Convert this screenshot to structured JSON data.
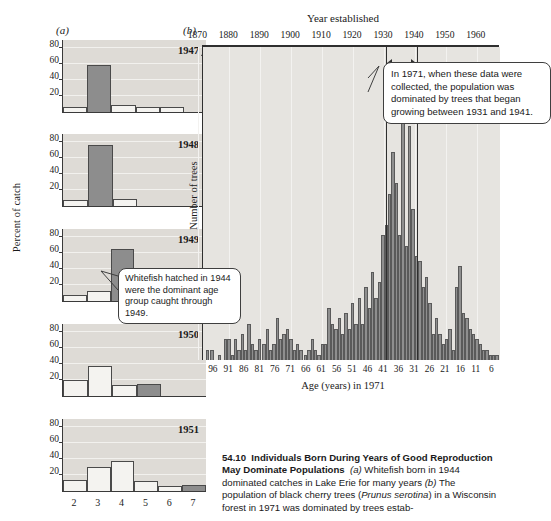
{
  "panel_a": {
    "letter": "(a)",
    "ylabel": "Percent of catch",
    "yticks": [
      20,
      40,
      60,
      80
    ],
    "xticks": [
      "2",
      "3",
      "4",
      "5",
      "6",
      "7"
    ],
    "callout": "Whitefish hatched in 1944 were the dominant age group caught through 1949."
  },
  "panel_b": {
    "letter": "(b)",
    "title": "Year established",
    "ylabel": "Number of trees",
    "xlabel": "Age (years) in 1971",
    "top_ticks": [
      1870,
      1880,
      1890,
      1900,
      1910,
      1920,
      1930,
      1940,
      1950,
      1960
    ],
    "bottom_ticks": [
      96,
      91,
      86,
      81,
      76,
      71,
      66,
      61,
      56,
      51,
      46,
      41,
      36,
      31,
      26,
      21,
      16,
      11,
      6
    ],
    "callout": "In 1971, when these data were collected, the population was dominated by trees that began growing between 1931 and 1941."
  },
  "caption": {
    "number": "54.10",
    "title": "Individuals Born During Years of Good Reproduction May Dominate Populations",
    "part_a_letter": "(a)",
    "part_a_text_1": "Whitefish born in 1944 dominated catches in Lake Erie for many years",
    "part_b_letter": "(b)",
    "part_b_text_1": "The population of black cherry trees (",
    "species": "Prunus serotina",
    "part_b_text_2": ") in a Wisconsin forest in 1971 was dominated by trees estab-"
  },
  "colors": {
    "plot_background": "#dedbd6",
    "bar_dark": "#8d8d8d",
    "bar_light": "#f4f3f0",
    "axis": "#3a3a3a"
  },
  "chart_data": [
    {
      "type": "bar",
      "title": "1947",
      "xlabel": "Age (years)",
      "ylabel": "Percent of catch",
      "ylim": [
        0,
        90
      ],
      "categories": [
        "2",
        "3",
        "4",
        "5",
        "6",
        "7"
      ],
      "values": [
        6,
        59,
        9,
        6,
        6,
        0
      ],
      "highlight_index": 1,
      "grid": true
    },
    {
      "type": "bar",
      "title": "1948",
      "xlabel": "Age (years)",
      "ylabel": "Percent of catch",
      "ylim": [
        0,
        90
      ],
      "categories": [
        "2",
        "3",
        "4",
        "5",
        "6",
        "7"
      ],
      "values": [
        7,
        76,
        9,
        0,
        0,
        0
      ],
      "highlight_index": 1,
      "grid": true
    },
    {
      "type": "bar",
      "title": "1949",
      "xlabel": "Age (years)",
      "ylabel": "Percent of catch",
      "ylim": [
        0,
        90
      ],
      "categories": [
        "2",
        "3",
        "4",
        "5",
        "6",
        "7"
      ],
      "values": [
        7,
        12,
        65,
        7,
        7,
        7
      ],
      "highlight_index": 2,
      "grid": true
    },
    {
      "type": "bar",
      "title": "1950",
      "xlabel": "Age (years)",
      "ylabel": "Percent of catch",
      "ylim": [
        0,
        90
      ],
      "categories": [
        "2",
        "3",
        "4",
        "5",
        "6",
        "7"
      ],
      "values": [
        20,
        38,
        14,
        15,
        0,
        0
      ],
      "highlight_index": 3,
      "grid": true
    },
    {
      "type": "bar",
      "title": "1951",
      "xlabel": "Age (years)",
      "ylabel": "Percent of catch",
      "ylim": [
        0,
        90
      ],
      "categories": [
        "2",
        "3",
        "4",
        "5",
        "6",
        "7"
      ],
      "values": [
        14,
        30,
        37,
        13,
        6,
        7
      ],
      "highlight_index": 5,
      "grid": true
    },
    {
      "type": "bar",
      "title": "Number of trees by year established",
      "xlabel": "Age (years) in 1971",
      "ylabel": "Number of trees",
      "x_top_label": "Year established",
      "ylim": [
        0,
        60
      ],
      "x_top_range": [
        1870,
        1965
      ],
      "age_range": [
        99,
        4
      ],
      "highlight_range_years": [
        1931,
        1941
      ],
      "categories": [
        99,
        98,
        97,
        96,
        95,
        94,
        93,
        92,
        91,
        90,
        89,
        88,
        87,
        86,
        85,
        84,
        83,
        82,
        81,
        80,
        79,
        78,
        77,
        76,
        75,
        74,
        73,
        72,
        71,
        70,
        69,
        68,
        67,
        66,
        65,
        64,
        63,
        62,
        61,
        60,
        59,
        58,
        57,
        56,
        55,
        54,
        53,
        52,
        51,
        50,
        49,
        48,
        47,
        46,
        45,
        44,
        43,
        42,
        41,
        40,
        39,
        38,
        37,
        36,
        35,
        34,
        33,
        32,
        31,
        30,
        29,
        28,
        27,
        26,
        25,
        24,
        23,
        22,
        21,
        20,
        19,
        18,
        17,
        16,
        15,
        14,
        13,
        12,
        11,
        10,
        9,
        8,
        7,
        6,
        5
      ],
      "values": [
        0,
        0,
        2,
        0,
        2,
        0,
        0,
        0,
        1,
        0,
        0,
        4,
        4,
        1,
        4,
        2,
        5,
        2,
        7,
        3,
        2,
        4,
        0,
        3,
        6,
        2,
        3,
        8,
        4,
        5,
        6,
        4,
        2,
        3,
        2,
        0,
        1,
        2,
        4,
        2,
        1,
        3,
        3,
        10,
        7,
        6,
        8,
        5,
        9,
        6,
        11,
        7,
        12,
        7,
        14,
        10,
        17,
        12,
        15,
        24,
        26,
        32,
        40,
        34,
        24,
        56,
        22,
        45,
        29,
        20,
        19,
        14,
        16,
        11,
        5,
        8,
        5,
        3,
        4,
        6,
        2,
        14,
        18,
        9,
        8,
        6,
        5,
        4,
        3,
        2,
        2,
        1,
        1,
        1,
        0
      ]
    }
  ]
}
